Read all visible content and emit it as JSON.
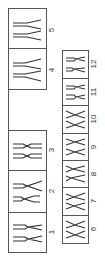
{
  "diagram": {
    "type": "karyotype",
    "orientation": "rotated-90",
    "line_color": "#555555",
    "top_row": [
      {
        "label": "1",
        "pair": 1
      },
      {
        "label": "2",
        "pair": 2
      },
      {
        "label": "3",
        "pair": 3
      },
      {
        "label": "4",
        "pair": 4
      },
      {
        "label": "5",
        "pair": 5
      }
    ],
    "bottom_row": [
      {
        "label": "6",
        "pair": 6
      },
      {
        "label": "7",
        "pair": 7
      },
      {
        "label": "8",
        "pair": 8
      },
      {
        "label": "9",
        "pair": 9
      },
      {
        "label": "10",
        "pair": 10
      },
      {
        "label": "11",
        "pair": 11
      },
      {
        "label": "12",
        "pair": 12
      }
    ]
  }
}
